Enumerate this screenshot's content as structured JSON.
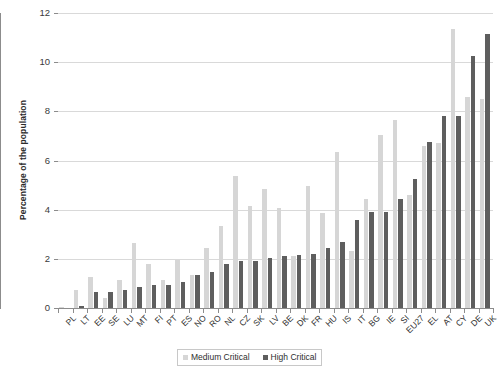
{
  "chart_data": {
    "type": "bar",
    "title": "",
    "xlabel": "",
    "ylabel": "Percentage of the population",
    "ylim": [
      0,
      12
    ],
    "yticks": [
      0,
      2,
      4,
      6,
      8,
      10,
      12
    ],
    "grid": true,
    "legend_position": "bottom",
    "colors": {
      "medium_critical": "#d6d6d6",
      "high_critical": "#5e5e5e",
      "gridline": "#d9d9d9",
      "axis": "#8c8c8c",
      "background": "#ffffff"
    },
    "categories": [
      "PL",
      "LT",
      "EE",
      "SE",
      "LU",
      "MT",
      "FI",
      "PT",
      "ES",
      "NO",
      "RO",
      "NL",
      "CZ",
      "SK",
      "LV",
      "BE",
      "DK",
      "FR",
      "HU",
      "IS",
      "IT",
      "BG",
      "IE",
      "SI",
      "EU27",
      "EL",
      "AT",
      "CY",
      "DE",
      "UK"
    ],
    "series": [
      {
        "name": "Medium Critical",
        "values": [
          0.05,
          0.75,
          1.25,
          0.4,
          1.15,
          2.65,
          1.8,
          1.15,
          1.95,
          1.35,
          2.45,
          3.35,
          5.35,
          4.15,
          4.85,
          4.05,
          2.1,
          4.95,
          3.85,
          6.35,
          2.3,
          4.45,
          7.05,
          7.65,
          4.6,
          6.6,
          6.7,
          11.35,
          8.6,
          8.5
        ]
      },
      {
        "name": "High Critical",
        "values": [
          0.0,
          0.1,
          0.65,
          0.65,
          0.75,
          0.85,
          0.95,
          0.95,
          1.05,
          1.35,
          1.45,
          1.8,
          1.9,
          1.9,
          2.05,
          2.1,
          2.15,
          2.2,
          2.45,
          2.7,
          3.6,
          3.9,
          3.9,
          4.45,
          5.25,
          6.75,
          7.8,
          7.8,
          10.25,
          11.15
        ]
      }
    ],
    "legend": [
      {
        "label": "Medium Critical",
        "swatch": "medium-critical-swatch"
      },
      {
        "label": "High Critical",
        "swatch": "high-critical-swatch"
      }
    ]
  }
}
